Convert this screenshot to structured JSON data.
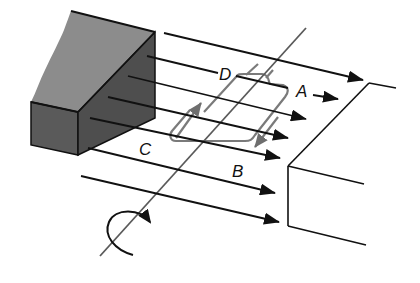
{
  "diagram": {
    "title": "",
    "labels": {
      "side_a": "A",
      "side_b": "B",
      "side_c": "C",
      "side_d": "D"
    },
    "components": {
      "left_pole": "magnet-pole-block",
      "right_pole": "magnet-pole-outline",
      "field_lines_count": 7,
      "coil": "rectangular-loop",
      "rotation_axis": "axle",
      "rotation_indicator": "curved-arrow"
    },
    "colors": {
      "line": "#111111",
      "coil": "#7a7a7a",
      "magnet_top": "#8c8c8c",
      "magnet_front": "#555555",
      "magnet_side": "#4a4a4a",
      "background": "#ffffff"
    }
  }
}
